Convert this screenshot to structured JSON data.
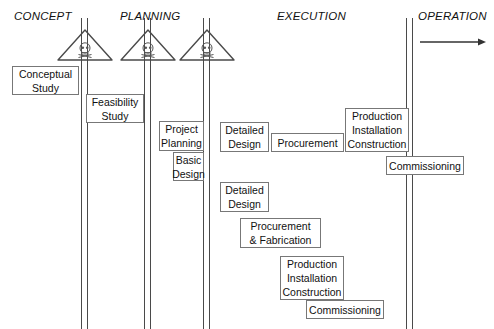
{
  "diagram": {
    "title_labels": [
      {
        "text": "CONCEPT",
        "x": 14,
        "y": 10
      },
      {
        "text": "PLANNING",
        "x": 120,
        "y": 10
      },
      {
        "text": "EXECUTION",
        "x": 277,
        "y": 10
      },
      {
        "text": "OPERATION",
        "x": 418,
        "y": 10
      }
    ],
    "gate_lines": [
      {
        "name": "gate-line-1",
        "x": 81,
        "y": 18,
        "height": 311
      },
      {
        "name": "gate-line-2",
        "x": 144,
        "y": 18,
        "height": 311
      },
      {
        "name": "gate-line-3",
        "x": 203,
        "y": 18,
        "height": 311
      },
      {
        "name": "gate-line-4",
        "x": 406,
        "y": 18,
        "height": 311
      }
    ],
    "gates": [
      {
        "name": "hazard-gate-1",
        "x": 56,
        "y": 28
      },
      {
        "name": "hazard-gate-2",
        "x": 119,
        "y": 28
      },
      {
        "name": "hazard-gate-3",
        "x": 178,
        "y": 28
      }
    ],
    "arrow": {
      "x": 420,
      "y": 34,
      "width": 66
    },
    "boxes": [
      {
        "name": "box-conceptual-study",
        "x": 12,
        "y": 66,
        "w": 67,
        "h": 29,
        "lines": [
          "Conceptual",
          "Study"
        ]
      },
      {
        "name": "box-feasibility-study",
        "x": 86,
        "y": 94,
        "w": 58,
        "h": 29,
        "lines": [
          "Feasibility",
          "Study"
        ]
      },
      {
        "name": "box-project-planning",
        "x": 159,
        "y": 121,
        "w": 45,
        "h": 30,
        "lines": [
          "Project",
          "Planning"
        ]
      },
      {
        "name": "box-basic-design",
        "x": 173,
        "y": 152,
        "w": 31,
        "h": 29,
        "lines": [
          "Basic",
          "Design"
        ]
      },
      {
        "name": "box-detailed-design-upper",
        "x": 220,
        "y": 122,
        "w": 49,
        "h": 30,
        "lines": [
          "Detailed",
          "Design"
        ]
      },
      {
        "name": "box-procurement",
        "x": 271,
        "y": 133,
        "w": 73,
        "h": 19,
        "lines": [
          "Procurement"
        ]
      },
      {
        "name": "box-production-upper",
        "x": 345,
        "y": 108,
        "w": 64,
        "h": 44,
        "lines": [
          "Production",
          "Installation",
          "Construction"
        ]
      },
      {
        "name": "box-commissioning-upper",
        "x": 386,
        "y": 156,
        "w": 78,
        "h": 19,
        "lines": [
          "Commissioning"
        ]
      },
      {
        "name": "box-detailed-design-lower",
        "x": 220,
        "y": 182,
        "w": 49,
        "h": 30,
        "lines": [
          "Detailed",
          "Design"
        ]
      },
      {
        "name": "box-procurement-fabrication",
        "x": 240,
        "y": 218,
        "w": 81,
        "h": 30,
        "lines": [
          "Procurement",
          "& Fabrication"
        ]
      },
      {
        "name": "box-production-lower",
        "x": 280,
        "y": 256,
        "w": 64,
        "h": 44,
        "lines": [
          "Production",
          "Installation",
          "Construction"
        ]
      },
      {
        "name": "box-commissioning-lower",
        "x": 306,
        "y": 300,
        "w": 78,
        "h": 19,
        "lines": [
          "Commissioning"
        ]
      }
    ],
    "colors": {
      "line": "#4a4a4a",
      "box_border": "#777777",
      "text": "#111111",
      "background": "#ffffff"
    }
  }
}
